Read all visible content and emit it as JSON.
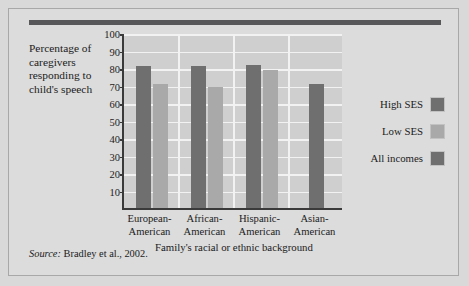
{
  "figure": {
    "ylabel": "Percentage of caregivers responding to child's speech",
    "xlabel": "Family's racial or ethnic background",
    "source_prefix": "Source:",
    "source_text": "Bradley et al., 2002."
  },
  "legend": {
    "items": [
      {
        "label": "High SES",
        "color": "#6f6f6f"
      },
      {
        "label": "Low SES",
        "color": "#a9a9a9"
      },
      {
        "label": "All incomes",
        "color": "#6f6f6f"
      }
    ]
  },
  "colors": {
    "page_background": "#d9d9d9",
    "figure_background": "#dcdcdc",
    "plot_background": "#cfcfcf",
    "gridline": "#f2f2f2",
    "axis": "#3a3a3a",
    "top_rule": "#58585a",
    "high_ses": "#6f6f6f",
    "low_ses": "#a9a9a9",
    "all_incomes": "#6f6f6f"
  },
  "chart_data": {
    "type": "bar",
    "title": "",
    "xlabel": "Family's racial or ethnic background",
    "ylabel": "Percentage of caregivers responding to child's speech",
    "categories": [
      "European-American",
      "African-American",
      "Hispanic-American",
      "Asian-American"
    ],
    "category_lines": [
      [
        "European-",
        "American"
      ],
      [
        "African-",
        "American"
      ],
      [
        "Hispanic-",
        "American"
      ],
      [
        "Asian-",
        "American"
      ]
    ],
    "series": [
      {
        "name": "High SES",
        "color": "#6f6f6f",
        "values": [
          81,
          81,
          82,
          null
        ]
      },
      {
        "name": "Low SES",
        "color": "#a9a9a9",
        "values": [
          71,
          69,
          79,
          null
        ]
      },
      {
        "name": "All incomes",
        "color": "#6f6f6f",
        "values": [
          null,
          null,
          null,
          71
        ]
      }
    ],
    "ylim": [
      0,
      100
    ],
    "yticks": [
      10,
      20,
      30,
      40,
      50,
      60,
      70,
      80,
      90,
      100
    ],
    "grid": true,
    "legend_position": "right"
  }
}
